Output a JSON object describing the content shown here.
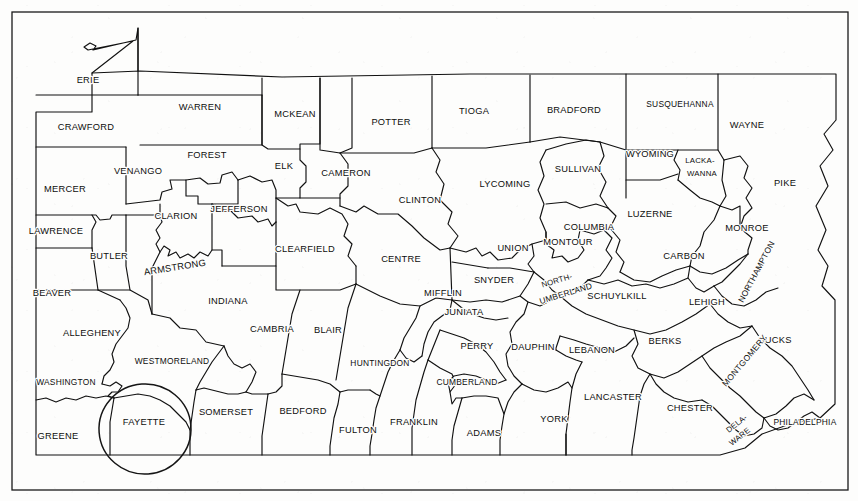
{
  "map": {
    "title": "Pennsylvania County Map",
    "state": "Pennsylvania",
    "county_count": 67,
    "frame": {
      "color": "#1a1a1a"
    },
    "annotation": {
      "type": "hand-drawn-circle",
      "target_county": "FAYETTE",
      "color": "#151515"
    },
    "counties": [
      {
        "name": "ERIE",
        "x": 88,
        "y": 81
      },
      {
        "name": "CRAWFORD",
        "x": 86,
        "y": 128
      },
      {
        "name": "WARREN",
        "x": 200,
        "y": 108
      },
      {
        "name": "MCKEAN",
        "x": 295,
        "y": 115
      },
      {
        "name": "POTTER",
        "x": 391,
        "y": 123
      },
      {
        "name": "TIOGA",
        "x": 474,
        "y": 112
      },
      {
        "name": "BRADFORD",
        "x": 574,
        "y": 111
      },
      {
        "name": "SUSQUEHANNA",
        "x": 680,
        "y": 105
      },
      {
        "name": "WAYNE",
        "x": 747,
        "y": 126
      },
      {
        "name": "FOREST",
        "x": 207,
        "y": 156
      },
      {
        "name": "VENANGO",
        "x": 138,
        "y": 172
      },
      {
        "name": "MERCER",
        "x": 65,
        "y": 190
      },
      {
        "name": "ELK",
        "x": 284,
        "y": 167
      },
      {
        "name": "CAMERON",
        "x": 346,
        "y": 174
      },
      {
        "name": "CLINTON",
        "x": 420,
        "y": 201
      },
      {
        "name": "LYCOMING",
        "x": 505,
        "y": 185
      },
      {
        "name": "SULLIVAN",
        "x": 578,
        "y": 170
      },
      {
        "name": "WYOMING",
        "x": 650,
        "y": 155
      },
      {
        "name": "LACKA-",
        "x": 700,
        "y": 161
      },
      {
        "name": "WANNA",
        "x": 702,
        "y": 174
      },
      {
        "name": "PIKE",
        "x": 785,
        "y": 184
      },
      {
        "name": "LAWRENCE",
        "x": 56,
        "y": 232
      },
      {
        "name": "CLARION",
        "x": 176,
        "y": 217
      },
      {
        "name": "JEFFERSON",
        "x": 239,
        "y": 210
      },
      {
        "name": "CLEARFIELD",
        "x": 305,
        "y": 250
      },
      {
        "name": "CENTRE",
        "x": 401,
        "y": 260
      },
      {
        "name": "UNION",
        "x": 513,
        "y": 249
      },
      {
        "name": "COLUMBIA",
        "x": 589,
        "y": 228
      },
      {
        "name": "MONTOUR",
        "x": 568,
        "y": 243
      },
      {
        "name": "LUZERNE",
        "x": 650,
        "y": 215
      },
      {
        "name": "MONROE",
        "x": 747,
        "y": 229
      },
      {
        "name": "CARBON",
        "x": 684,
        "y": 257
      },
      {
        "name": "BUTLER",
        "x": 109,
        "y": 257
      },
      {
        "name": "ARMSTRONG",
        "x": 175,
        "y": 268
      },
      {
        "name": "INDIANA",
        "x": 228,
        "y": 302
      },
      {
        "name": "BEAVER",
        "x": 52,
        "y": 294
      },
      {
        "name": "SNYDER",
        "x": 494,
        "y": 281
      },
      {
        "name": "MIFFLIN",
        "x": 443,
        "y": 294
      },
      {
        "name": "NORTH-",
        "x": 557,
        "y": 281
      },
      {
        "name": "UMBERLAND",
        "x": 566,
        "y": 294
      },
      {
        "name": "SCHUYLKILL",
        "x": 617,
        "y": 297
      },
      {
        "name": "LEHIGH",
        "x": 707,
        "y": 303
      },
      {
        "name": "NORTHAMPTON",
        "x": 757,
        "y": 272
      },
      {
        "name": "ALLEGHENY",
        "x": 92,
        "y": 334
      },
      {
        "name": "CAMBRIA",
        "x": 272,
        "y": 330
      },
      {
        "name": "BLAIR",
        "x": 328,
        "y": 331
      },
      {
        "name": "JUNIATA",
        "x": 464,
        "y": 313
      },
      {
        "name": "PERRY",
        "x": 477,
        "y": 347
      },
      {
        "name": "DAUPHIN",
        "x": 533,
        "y": 348
      },
      {
        "name": "LEBANON",
        "x": 592,
        "y": 351
      },
      {
        "name": "BERKS",
        "x": 665,
        "y": 342
      },
      {
        "name": "BUCKS",
        "x": 775,
        "y": 341
      },
      {
        "name": "MONTGOMERY",
        "x": 745,
        "y": 361
      },
      {
        "name": "WESTMORELAND",
        "x": 172,
        "y": 362
      },
      {
        "name": "HUNTINGDON",
        "x": 380,
        "y": 364
      },
      {
        "name": "CUMBERLAND",
        "x": 467,
        "y": 383
      },
      {
        "name": "WASHINGTON",
        "x": 66,
        "y": 383
      },
      {
        "name": "LANCASTER",
        "x": 613,
        "y": 398
      },
      {
        "name": "CHESTER",
        "x": 690,
        "y": 409
      },
      {
        "name": "SOMERSET",
        "x": 226,
        "y": 413
      },
      {
        "name": "BEDFORD",
        "x": 303,
        "y": 412
      },
      {
        "name": "FULTON",
        "x": 358,
        "y": 431
      },
      {
        "name": "FRANKLIN",
        "x": 414,
        "y": 423
      },
      {
        "name": "ADAMS",
        "x": 484,
        "y": 434
      },
      {
        "name": "YORK",
        "x": 554,
        "y": 420
      },
      {
        "name": "FAYETTE",
        "x": 144,
        "y": 423
      },
      {
        "name": "GREENE",
        "x": 58,
        "y": 437
      },
      {
        "name": "DELA-",
        "x": 737,
        "y": 424
      },
      {
        "name": "WARE",
        "x": 740,
        "y": 437
      },
      {
        "name": "PHILADELPHIA",
        "x": 805,
        "y": 423
      }
    ]
  }
}
